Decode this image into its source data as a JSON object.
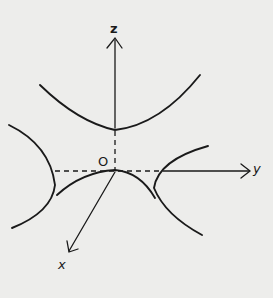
{
  "diagram": {
    "axes": {
      "z": {
        "label": "z"
      },
      "y": {
        "label": "y"
      },
      "x": {
        "label": "x"
      },
      "origin": {
        "label": "O"
      }
    },
    "colors": {
      "ink": "#1a1a1a",
      "paper": "#ededeb"
    }
  }
}
